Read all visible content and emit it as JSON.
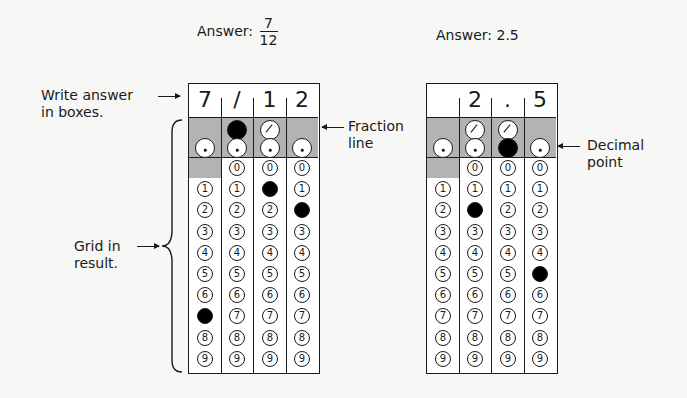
{
  "left_example": {
    "title_prefix": "Answer:",
    "fraction": {
      "numerator": "7",
      "denominator": "12"
    },
    "answer_boxes": [
      "7",
      "/",
      "1",
      "2"
    ],
    "fraction_line_filled_column": 1,
    "decimal_filled_column": null,
    "digit_fills": [
      7,
      0,
      1,
      2
    ],
    "digit_fill_note": "column 1 has fraction bubble filled; digit fills: col0=7, col2=1, col3=2",
    "annotations": {
      "write_answer": [
        "Write answer",
        "in boxes."
      ],
      "grid_in": [
        "Grid in",
        "result."
      ],
      "fraction_line": [
        "Fraction",
        "line"
      ]
    }
  },
  "right_example": {
    "title": "Answer: 2.5",
    "answer_boxes": [
      "",
      "2",
      ".",
      "5"
    ],
    "decimal_filled_column": 2,
    "digit_fills": [
      null,
      2,
      null,
      5
    ],
    "annotations": {
      "decimal_point": [
        "Decimal",
        "point"
      ]
    }
  },
  "digits": [
    "0",
    "1",
    "2",
    "3",
    "4",
    "5",
    "6",
    "7",
    "8",
    "9"
  ],
  "colors": {
    "ink": "#1a1a1a",
    "shade": "#b3b3b3",
    "paper": "#f7f7f5",
    "fill": "#000000"
  }
}
